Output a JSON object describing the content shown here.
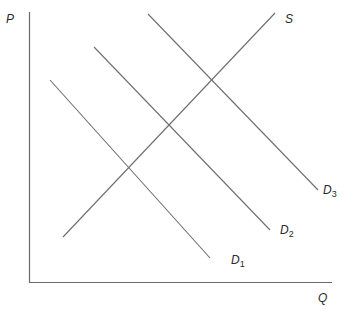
{
  "diagram": {
    "type": "supply-demand",
    "axes": {
      "y_label": "P",
      "x_label": "Q",
      "color": "#707070"
    },
    "curves": [
      {
        "id": "S",
        "label": "S",
        "sub": "",
        "x1": 63,
        "y1": 237,
        "x2": 275,
        "y2": 13,
        "lx": 285,
        "ly": 13
      },
      {
        "id": "D1",
        "label": "D",
        "sub": "1",
        "x1": 50,
        "y1": 80,
        "x2": 210,
        "y2": 258,
        "lx": 231,
        "ly": 254
      },
      {
        "id": "D2",
        "label": "D",
        "sub": "2",
        "x1": 94,
        "y1": 47,
        "x2": 270,
        "y2": 230,
        "lx": 280,
        "ly": 224
      },
      {
        "id": "D3",
        "label": "D",
        "sub": "3",
        "x1": 148,
        "y1": 14,
        "x2": 318,
        "y2": 190,
        "lx": 323,
        "ly": 184
      }
    ],
    "line_color": "#6e6e6e"
  }
}
